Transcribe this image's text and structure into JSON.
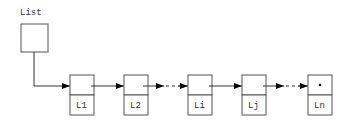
{
  "diagram": {
    "type": "singly-linked-list",
    "head_label": "List",
    "nodes": [
      {
        "label": "L1",
        "x": 70
      },
      {
        "label": "L2",
        "x": 124
      },
      {
        "label": "Li",
        "x": 188
      },
      {
        "label": "Lj",
        "x": 242
      },
      {
        "label": "Ln",
        "x": 308,
        "null_pointer": true
      }
    ],
    "null_marker": "•",
    "colors": {
      "stroke": "#555555",
      "arrow": "#000000"
    }
  }
}
